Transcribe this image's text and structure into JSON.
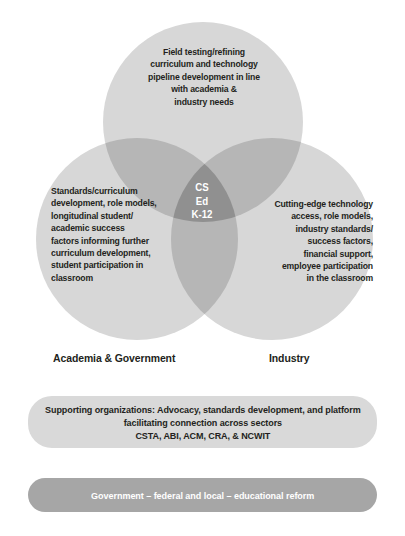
{
  "diagram": {
    "type": "venn-3-circle",
    "circles": [
      {
        "id": "top",
        "name": "field-testing",
        "text": "Field testing/refining\ncurriculum and technology\npipeline development in line\nwith academia &\nindustry needs",
        "center": [
          203,
          122
        ],
        "radius": 100,
        "fill": "#d7d7d7"
      },
      {
        "id": "left",
        "name": "academia-government",
        "caption": "Academia & Government",
        "text": "Standards/curriculum\ndevelopment, role models,\nlongitudinal student/\nacademic success\nfactors informing further\ncurriculum development,\nstudent participation in\nclassroom",
        "center": [
          137,
          239
        ],
        "radius": 101,
        "fill": "#d7d7d7"
      },
      {
        "id": "right",
        "name": "industry",
        "caption": "Industry",
        "text": "Cutting-edge technology\naccess, role models,\nindustry standards/\nsuccess factors,\nfinancial support,\nemployee participation\nin the classroom",
        "center": [
          272,
          239
        ],
        "radius": 101,
        "fill": "#d7d7d7"
      }
    ],
    "intersection": {
      "name": "cs-ed-k12",
      "label": "CS\nEd\nK-12",
      "text_color": "#ffffff",
      "fill": "#8f8f8f"
    }
  },
  "bands": [
    {
      "id": "support",
      "name": "supporting-organizations",
      "text": "Supporting organizations: Advocacy, standards development, and platform\nfacilitating connection across sectors\nCSTA, ABI, ACM, CRA, & NCWIT",
      "background": "#d9d9d9",
      "text_color": "#231f20"
    },
    {
      "id": "government",
      "name": "government-reform",
      "text": "Government – federal and local – educational reform",
      "background": "#a6a6a6",
      "text_color": "#ffffff"
    }
  ],
  "colors": {
    "page_background": "#ffffff",
    "circle_fill": "#d7d7d7",
    "double_overlap": "#b4b4b4",
    "triple_overlap": "#8f8f8f",
    "band_light": "#d9d9d9",
    "band_dark": "#a6a6a6",
    "text_dark": "#231f20",
    "text_light": "#ffffff"
  }
}
